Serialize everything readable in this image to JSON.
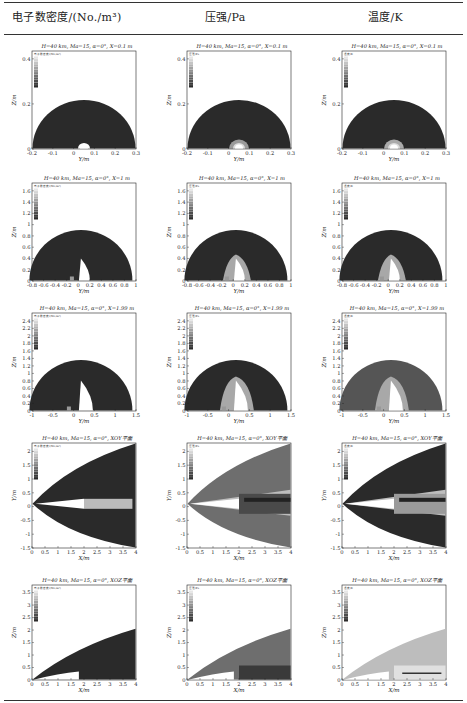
{
  "header": {
    "col1": "电子数密度/(No./m³)",
    "col2": "压强/Pa",
    "col3": "温度/K"
  },
  "legend_titles": [
    "电子数密度/(No./m³)",
    "压强/Pa",
    "温度/K"
  ],
  "rows": [
    {
      "title": "H=40 km, Ma=15, α=0°, X=0.1 m",
      "xlabel": "Y/m",
      "ylabel": "Z/m",
      "xticks": [
        "-0.2",
        "-0.1",
        "0",
        "0.1",
        "0.2",
        "0.3"
      ],
      "yticks": [
        "0",
        "0.2",
        "0.4"
      ]
    },
    {
      "title": "H=40 km, Ma=15, α=0°, X=1 m",
      "xlabel": "Y/m",
      "ylabel": "Z/m",
      "xticks": [
        "-0.8",
        "-0.6",
        "-0.4",
        "-0.2",
        "0",
        "0.2",
        "0.4",
        "0.6",
        "0.8",
        "1"
      ],
      "yticks": [
        "0",
        "0.2",
        "0.4",
        "0.6",
        "0.8",
        "1",
        "1.2",
        "1.4",
        "1.6"
      ]
    },
    {
      "title": "H=40 km, Ma=15, α=0°, X=1.99 m",
      "xlabel": "Y/m",
      "ylabel": "Z/m",
      "xticks": [
        "-1",
        "-0.5",
        "0",
        "0.5",
        "1",
        "1.5"
      ],
      "yticks": [
        "0",
        "0.2",
        "0.4",
        "0.6",
        "0.8",
        "1",
        "1.2",
        "1.4",
        "1.6",
        "1.8",
        "2",
        "2.2",
        "2.4"
      ]
    },
    {
      "title": "H=40 km, Ma=15, α=0°, XOY平面",
      "xlabel": "X/m",
      "ylabel": "Y/m",
      "xticks": [
        "0",
        "0.5",
        "1",
        "1.5",
        "2",
        "2.5",
        "3",
        "3.5",
        "4"
      ],
      "yticks": [
        "-1.5",
        "-1",
        "-0.5",
        "0",
        "0.5",
        "1",
        "1.5",
        "2"
      ]
    },
    {
      "title": "H=40 km, Ma=15, α=0°, XOZ平面",
      "xlabel": "X/m",
      "ylabel": "Z/m",
      "xticks": [
        "0",
        "0.5",
        "1",
        "1.5",
        "2",
        "2.5",
        "3",
        "3.5",
        "4"
      ],
      "yticks": [
        "0",
        "0.5",
        "1",
        "1.5",
        "2",
        "2.5",
        "3",
        "3.5"
      ]
    }
  ],
  "chart_data": [
    {
      "type": "heatmap",
      "row": 1,
      "column": "电子数密度/(No./m³)",
      "title": "H=40 km, Ma=15, α=0°, X=0.1 m",
      "xlabel": "Y/m",
      "ylabel": "Z/m",
      "xlim": [
        -0.3,
        0.3
      ],
      "ylim": [
        0,
        0.55
      ],
      "shock_radius": 0.28
    },
    {
      "type": "heatmap",
      "row": 1,
      "column": "压强/Pa",
      "title": "H=40 km, Ma=15, α=0°, X=0.1 m",
      "xlabel": "Y/m",
      "ylabel": "Z/m",
      "xlim": [
        -0.3,
        0.3
      ],
      "ylim": [
        0,
        0.55
      ]
    },
    {
      "type": "heatmap",
      "row": 1,
      "column": "温度/K",
      "title": "H=40 km, Ma=15, α=0°, X=0.1 m",
      "xlabel": "Y/m",
      "ylabel": "Z/m",
      "xlim": [
        -0.3,
        0.3
      ],
      "ylim": [
        0,
        0.55
      ]
    },
    {
      "type": "heatmap",
      "row": 2,
      "columns": [
        "电子数密度/(No./m³)",
        "压强/Pa",
        "温度/K"
      ],
      "title": "H=40 km, Ma=15, α=0°, X=1 m",
      "xlim": [
        -0.9,
        1
      ],
      "ylim": [
        0,
        1.7
      ],
      "shock_radius": 0.85
    },
    {
      "type": "heatmap",
      "row": 3,
      "columns": [
        "电子数密度/(No./m³)",
        "压强/Pa",
        "温度/K"
      ],
      "title": "H=40 km, Ma=15, α=0°, X=1.99 m",
      "xlim": [
        -1.2,
        1.5
      ],
      "ylim": [
        0,
        2.4
      ],
      "shock_radius": 1.3
    },
    {
      "type": "heatmap",
      "row": 4,
      "columns": [
        "电子数密度/(No./m³)",
        "压强/Pa",
        "温度/K"
      ],
      "title": "H=40 km, Ma=15, α=0°, XOY平面",
      "xlim": [
        0,
        4
      ],
      "ylim": [
        -1.7,
        2.2
      ]
    },
    {
      "type": "heatmap",
      "row": 5,
      "columns": [
        "电子数密度/(No./m³)",
        "压强/Pa",
        "温度/K"
      ],
      "title": "H=40 km, Ma=15, α=0°, XOZ平面",
      "xlim": [
        0,
        4
      ],
      "ylim": [
        0,
        3.7
      ]
    }
  ],
  "colors": {
    "dark": "#2a2a2a",
    "mid": "#7a7a7a",
    "light": "#c8c8c8",
    "white": "#ffffff"
  }
}
